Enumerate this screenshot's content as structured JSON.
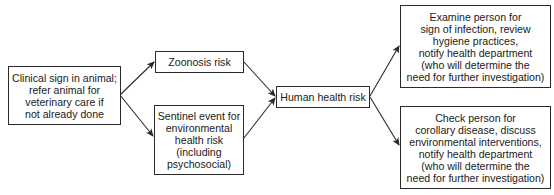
{
  "diagram": {
    "type": "flowchart",
    "nodes": [
      {
        "id": "clinical",
        "label": "Clinical sign in animal;\nrefer animal for\nveterinary care if\nnot already done"
      },
      {
        "id": "zoonosis",
        "label": "Zoonosis risk"
      },
      {
        "id": "sentinel",
        "label": "Sentinel event for\nenvironmental\nhealth risk\n(including\npsychosocial)"
      },
      {
        "id": "human",
        "label": "Human health risk"
      },
      {
        "id": "examine",
        "label": "Examine person for\nsign of infection, review\nhygiene practices,\nnotify health department\n(who will determine the\nneed for further investigation)"
      },
      {
        "id": "check",
        "label": "Check person for\ncorollary disease, discuss\nenvironmental interventions,\nnotify health department\n(who will determine the\nneed for further investigation)"
      }
    ],
    "edges": [
      {
        "from": "clinical",
        "to": "zoonosis"
      },
      {
        "from": "clinical",
        "to": "sentinel"
      },
      {
        "from": "zoonosis",
        "to": "human"
      },
      {
        "from": "sentinel",
        "to": "human"
      },
      {
        "from": "human",
        "to": "examine"
      },
      {
        "from": "human",
        "to": "check"
      }
    ],
    "colors": {
      "line": "#2a2a2a",
      "background": "#ffffff"
    }
  }
}
